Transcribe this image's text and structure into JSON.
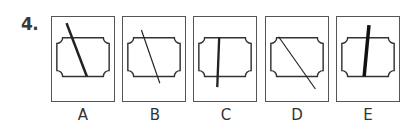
{
  "question": {
    "number": "4."
  },
  "colors": {
    "stroke": "#333333",
    "border": "#555555",
    "background": "#ffffff"
  },
  "options": [
    {
      "label": "A",
      "line": {
        "x1": 15,
        "y1": 6,
        "x2": 36,
        "y2": 61,
        "width": 2.6
      }
    },
    {
      "label": "B",
      "line": {
        "x1": 19,
        "y1": 13,
        "x2": 38,
        "y2": 68,
        "width": 1.2
      }
    },
    {
      "label": "C",
      "line": {
        "x1": 26,
        "y1": 21,
        "x2": 24,
        "y2": 72,
        "width": 2.4
      }
    },
    {
      "label": "D",
      "line": {
        "x1": 13,
        "y1": 20,
        "x2": 51,
        "y2": 74,
        "width": 1.2
      }
    },
    {
      "label": "E",
      "line": {
        "x1": 33,
        "y1": 8,
        "x2": 28,
        "y2": 61,
        "width": 3.6
      }
    }
  ],
  "inner_shape": {
    "left": 5,
    "top": 20,
    "right": 59,
    "bottom": 61,
    "notch_radius": 6
  }
}
